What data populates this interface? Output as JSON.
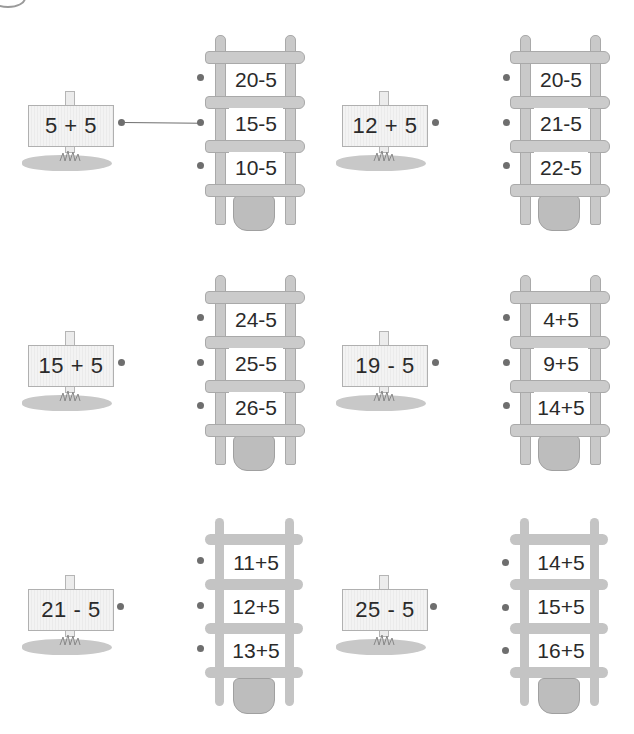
{
  "worksheet": {
    "colors": {
      "ink": "#2a2a2a",
      "dot": "#6e6e6e",
      "wood": "#c9c9c9",
      "ground": "#c8c8c8"
    },
    "problems": [
      {
        "sign": "5 + 5",
        "options": [
          "20-5",
          "15-5",
          "10-5"
        ],
        "answered": true,
        "connected_option": 1
      },
      {
        "sign": "12 + 5",
        "options": [
          "20-5",
          "21-5",
          "22-5"
        ],
        "answered": false
      },
      {
        "sign": "15 + 5",
        "options": [
          "24-5",
          "25-5",
          "26-5"
        ],
        "answered": false
      },
      {
        "sign": "19 - 5",
        "options": [
          "4+5",
          "9+5",
          "14+5"
        ],
        "answered": false
      },
      {
        "sign": "21 - 5",
        "options": [
          "11+5",
          "12+5",
          "13+5"
        ],
        "answered": false
      },
      {
        "sign": "25 - 5",
        "options": [
          "14+5",
          "15+5",
          "16+5"
        ],
        "answered": false
      }
    ]
  }
}
